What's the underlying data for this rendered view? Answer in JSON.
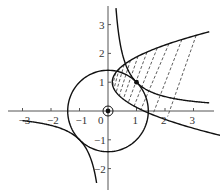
{
  "figure": {
    "type": "coordinate-plot",
    "axes": {
      "x_range": [
        -3.5,
        3.6
      ],
      "y_range": [
        -2.8,
        3.7
      ],
      "x_ticks": [
        {
          "value": -3,
          "label": "−3"
        },
        {
          "value": -2,
          "label": "−2"
        },
        {
          "value": -1,
          "label": "−1"
        },
        {
          "value": 1,
          "label": "1"
        },
        {
          "value": 2,
          "label": "2"
        },
        {
          "value": 3,
          "label": "3"
        }
      ],
      "y_ticks": [
        {
          "value": 3,
          "label": "3"
        },
        {
          "value": 2,
          "label": "2"
        },
        {
          "value": 1,
          "label": "1"
        },
        {
          "value": -1,
          "label": "−1"
        },
        {
          "value": -2,
          "label": "−2"
        }
      ],
      "origin_label": "0"
    },
    "curves": [
      {
        "name": "circle",
        "equation": "x^2 + y^2 = 2",
        "radius_squared": 2
      },
      {
        "name": "hyperbola",
        "equation": "x*y = 1"
      },
      {
        "name": "parabola",
        "equation": "(y-1)^2 = 0.9*(x-0.15)",
        "k": 0.9,
        "x0": 0.15,
        "y0": 1
      }
    ],
    "points": [
      {
        "name": "intersection-point",
        "x": 1,
        "y": 1
      },
      {
        "name": "origin-point",
        "x": 0,
        "y": 0
      }
    ],
    "hatch": {
      "style": "dashed",
      "count": 10
    }
  }
}
